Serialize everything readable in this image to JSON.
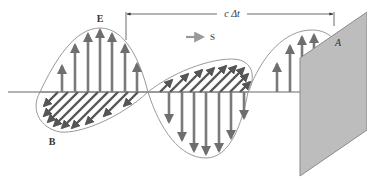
{
  "figure": {
    "type": "electromagnetic-wave-diagram",
    "labels": {
      "electric_field": "E",
      "magnetic_field": "B",
      "poynting_vector": "S",
      "area": "A",
      "distance": "c Δt"
    },
    "colors": {
      "arrow": "#7a7a7a",
      "arrow_dark": "#555555",
      "envelope": "#9a9a9a",
      "axis": "#666666",
      "plane_fill": "#bdbdbd",
      "plane_stroke": "#8a8a8a",
      "text": "#333333",
      "dimension_line": "#444444"
    }
  }
}
